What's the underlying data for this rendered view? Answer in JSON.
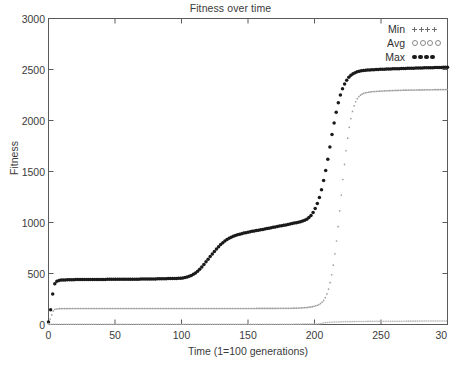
{
  "chart_data": {
    "type": "line",
    "title": "Fitness over time",
    "xlabel": "Time (1=100 generations)",
    "ylabel": "Fitness",
    "xlim": [
      0,
      300
    ],
    "ylim": [
      0,
      3000
    ],
    "xticks": [
      0,
      50,
      100,
      150,
      200,
      250,
      300
    ],
    "xtick_labels": [
      "0",
      "50",
      "100",
      "150",
      "200",
      "250",
      "30"
    ],
    "yticks": [
      0,
      500,
      1000,
      1500,
      2000,
      2500,
      3000
    ],
    "ytick_labels": [
      "0",
      "500",
      "1000",
      "1500",
      "2000",
      "2500",
      "3000"
    ],
    "grid": false,
    "legend_position": "top-right",
    "legend": [
      "Min",
      "Avg",
      "Max"
    ],
    "series": [
      {
        "name": "Max",
        "marker": "filled-dot",
        "color": "#1a1a1a",
        "x": [
          0,
          2,
          4,
          6,
          8,
          12,
          20,
          30,
          40,
          50,
          60,
          70,
          80,
          90,
          100,
          105,
          110,
          115,
          120,
          125,
          130,
          135,
          140,
          145,
          150,
          155,
          160,
          165,
          170,
          175,
          180,
          185,
          190,
          195,
          198,
          201,
          204,
          207,
          210,
          213,
          216,
          219,
          222,
          225,
          228,
          231,
          234,
          238,
          242,
          247,
          252,
          258,
          265,
          272,
          280,
          288,
          296,
          300
        ],
        "y": [
          25,
          180,
          370,
          420,
          432,
          437,
          440,
          441,
          442,
          443,
          444,
          445,
          447,
          450,
          455,
          470,
          500,
          560,
          640,
          720,
          790,
          840,
          870,
          890,
          905,
          918,
          930,
          942,
          955,
          968,
          980,
          995,
          1010,
          1040,
          1080,
          1150,
          1260,
          1420,
          1620,
          1850,
          2060,
          2230,
          2340,
          2410,
          2450,
          2472,
          2484,
          2492,
          2496,
          2500,
          2503,
          2506,
          2509,
          2512,
          2515,
          2518,
          2521,
          2523
        ]
      },
      {
        "name": "Avg",
        "marker": "open-circle",
        "color": "#9e9e9e",
        "x": [
          0,
          2,
          4,
          6,
          8,
          12,
          20,
          30,
          50,
          70,
          90,
          110,
          130,
          150,
          170,
          185,
          195,
          200,
          205,
          208,
          211,
          214,
          217,
          220,
          223,
          226,
          229,
          232,
          236,
          241,
          247,
          254,
          262,
          271,
          281,
          291,
          300
        ],
        "y": [
          10,
          80,
          140,
          152,
          155,
          156,
          157,
          157,
          157,
          157,
          157,
          157,
          157,
          157,
          158,
          160,
          168,
          180,
          210,
          260,
          370,
          570,
          870,
          1250,
          1620,
          1920,
          2110,
          2210,
          2260,
          2278,
          2286,
          2291,
          2295,
          2298,
          2300,
          2302,
          2304
        ]
      },
      {
        "name": "Min",
        "marker": "plus",
        "color": "#b3b3b3",
        "x": [
          0,
          3,
          8,
          20,
          40,
          60,
          80,
          100,
          120,
          140,
          160,
          180,
          195,
          203,
          207,
          212,
          220,
          232,
          245,
          260,
          275,
          290,
          300
        ],
        "y": [
          0,
          2,
          3,
          3,
          3,
          3,
          3,
          3,
          3,
          3,
          3,
          3,
          4,
          6,
          16,
          22,
          26,
          29,
          31,
          32,
          33,
          34,
          34
        ]
      }
    ]
  },
  "legend": {
    "rows": [
      {
        "label": "Min",
        "marker": "plus"
      },
      {
        "label": "Avg",
        "marker": "open-circle"
      },
      {
        "label": "Max",
        "marker": "filled-dot"
      }
    ]
  }
}
